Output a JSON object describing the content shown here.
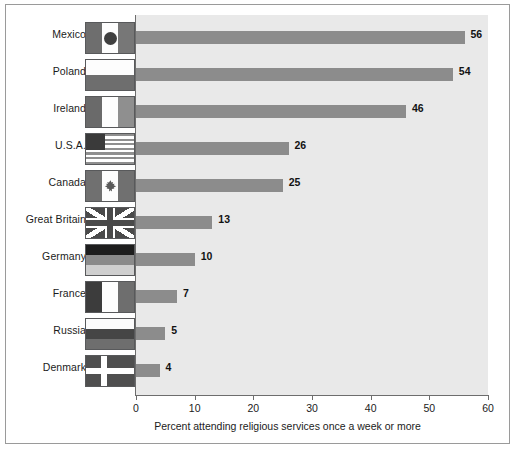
{
  "chart_data": {
    "type": "bar",
    "orientation": "horizontal",
    "title": "",
    "xlabel": "Percent attending religious services once a week or more",
    "ylabel": "",
    "xlim": [
      0,
      60
    ],
    "xticks": [
      0,
      10,
      20,
      30,
      40,
      50,
      60
    ],
    "grid": false,
    "legend": "none",
    "categories": [
      "Mexico",
      "Poland",
      "Ireland",
      "U.S.A.",
      "Canada",
      "Great Britain",
      "Germany",
      "France",
      "Russia",
      "Denmark"
    ],
    "values": [
      56,
      54,
      46,
      26,
      25,
      13,
      10,
      7,
      5,
      4
    ],
    "value_labels": [
      "56",
      "54",
      "46",
      "26",
      "25",
      "13",
      "10",
      "7",
      "5",
      "4"
    ],
    "colors": {
      "bar": "#8c8c8c",
      "plot_background": "#e9e9e9",
      "figure_background": "#ffffff",
      "axis": "#6d6d6d",
      "text": "#1b1b1b",
      "frame_border": "#9a9a9a"
    }
  },
  "rows": [
    {
      "country": "Mexico",
      "value": 56,
      "label": "56",
      "flag": "flag-mexico"
    },
    {
      "country": "Poland",
      "value": 54,
      "label": "54",
      "flag": "flag-poland"
    },
    {
      "country": "Ireland",
      "value": 46,
      "label": "46",
      "flag": "flag-ireland"
    },
    {
      "country": "U.S.A.",
      "value": 26,
      "label": "26",
      "flag": "flag-usa"
    },
    {
      "country": "Canada",
      "value": 25,
      "label": "25",
      "flag": "flag-canada"
    },
    {
      "country": "Great Britain",
      "value": 13,
      "label": "13",
      "flag": "flag-great-britain"
    },
    {
      "country": "Germany",
      "value": 10,
      "label": "10",
      "flag": "flag-germany"
    },
    {
      "country": "France",
      "value": 7,
      "label": "7",
      "flag": "flag-france"
    },
    {
      "country": "Russia",
      "value": 5,
      "label": "5",
      "flag": "flag-russia"
    },
    {
      "country": "Denmark",
      "value": 4,
      "label": "4",
      "flag": "flag-denmark"
    }
  ],
  "axis": {
    "ticks": [
      "0",
      "10",
      "20",
      "30",
      "40",
      "50",
      "60"
    ],
    "title": "Percent attending religious services once a week or more"
  }
}
